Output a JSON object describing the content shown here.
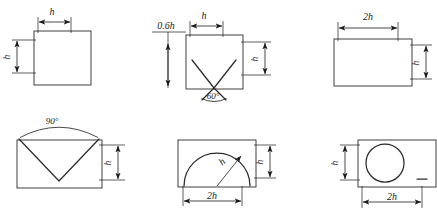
{
  "figure": {
    "background_color": "#ffffff",
    "line_color": "#2b2b2b",
    "mesh_color": "#3a3a3a",
    "panel_count": 6
  },
  "panels": [
    {
      "id": "panel-square-h",
      "position": "top-left",
      "shape": "square-mesh",
      "overlay": "none",
      "labels": {
        "width": "h",
        "height": "h"
      }
    },
    {
      "id": "panel-square-v-60",
      "position": "top-center",
      "shape": "square-mesh",
      "overlay": "vee",
      "labels": {
        "offset": "0.6h",
        "width": "h",
        "height": "h",
        "angle": "60°"
      }
    },
    {
      "id": "panel-wide-2h",
      "position": "top-right",
      "shape": "rectangle-mesh",
      "overlay": "none",
      "labels": {
        "width": "2h",
        "height": "h"
      }
    },
    {
      "id": "panel-vee-90",
      "position": "bottom-left",
      "shape": "rectangle-mesh",
      "overlay": "vee",
      "labels": {
        "angle": "90°",
        "height": "h"
      }
    },
    {
      "id": "panel-arc-2h",
      "position": "bottom-center",
      "shape": "rectangle-mesh",
      "overlay": "arc",
      "labels": {
        "radius": "h",
        "width": "2h",
        "height": "h"
      }
    },
    {
      "id": "panel-circle-2h",
      "position": "bottom-right",
      "shape": "rectangle-mesh",
      "overlay": "circle",
      "labels": {
        "height": "h",
        "width": "2h"
      }
    }
  ]
}
